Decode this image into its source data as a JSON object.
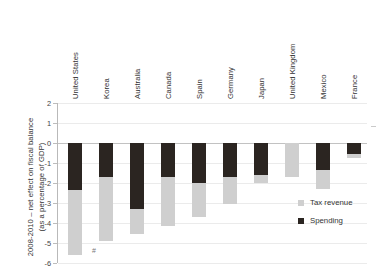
{
  "axis_title": "2008-2010 – net effect on fiscal balance\n(as a percentage of GDP)",
  "legend": {
    "tax_label": "Tax revenue",
    "spending_label": "Spending"
  },
  "footnote_marker": "#",
  "colors": {
    "spending": "#2b2521",
    "tax_revenue": "#cfcfcf",
    "gridline": "#ebebeb",
    "axis": "#b9b9b9"
  },
  "chart_data": {
    "type": "bar",
    "title": "",
    "subtitle": "",
    "xlabel": "",
    "ylabel": "2008-2010 – net effect on fiscal balance (as a percentage of GDP)",
    "ylim": [
      -6,
      2
    ],
    "yticks": [
      2,
      1,
      0,
      -1,
      -2,
      -3,
      -4,
      -5,
      -6
    ],
    "ytick_labels": [
      "2",
      "1",
      "0",
      "-1",
      "-2",
      "-3",
      "-4",
      "-5",
      "-6"
    ],
    "grid": true,
    "stacked": true,
    "legend_position": "bottom-right",
    "categories": [
      "United States",
      "Korea",
      "Australia",
      "Canada",
      "Spain",
      "Germany",
      "Japan",
      "United Kingdom",
      "Mexico",
      "France"
    ],
    "series": [
      {
        "name": "Spending",
        "color": "#2b2521",
        "values": [
          -2.35,
          -1.7,
          -3.3,
          -1.7,
          -2.0,
          -1.7,
          -1.6,
          0.0,
          -2.3,
          -0.55
        ]
      },
      {
        "name": "Tax revenue",
        "color": "#cfcfcf",
        "values": [
          -3.25,
          -3.2,
          -1.25,
          -2.45,
          -1.7,
          -1.35,
          -0.4,
          -1.7,
          0.95,
          -0.2
        ]
      }
    ],
    "totals": [
      -5.6,
      -4.9,
      -4.55,
      -4.15,
      -3.7,
      -3.05,
      -2.0,
      -1.7,
      -1.35,
      -0.75
    ]
  }
}
